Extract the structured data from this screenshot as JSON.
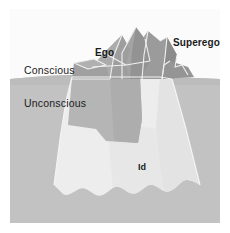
{
  "diagram": {
    "labels": {
      "conscious": "Conscious",
      "unconscious": "Unconscious",
      "ego": "Ego",
      "superego": "Superego",
      "id": "Id"
    },
    "colors": {
      "page_background": "#ffffff",
      "sky": "#fbfbfb",
      "water": "#c2c2c2",
      "water_shadow": "#b9b9b9",
      "ice_above_water": "#9b9b9b",
      "ice_above_water_light": "#b4b4b4",
      "ice_above_water_dark": "#8a8a8a",
      "ice_below_water": "#ededed",
      "ice_below_water_shade": "#e2e2e2",
      "ego_block": "#b5b5b5",
      "outline": "#f2f2f2",
      "text": "#1b1b1b"
    },
    "regions": [
      {
        "name": "conscious",
        "position": "above-waterline",
        "label": "Conscious"
      },
      {
        "name": "unconscious",
        "position": "below-waterline",
        "label": "Unconscious"
      },
      {
        "name": "ego",
        "position": "peak-left",
        "label": "Ego"
      },
      {
        "name": "superego",
        "position": "peak-right",
        "label": "Superego"
      },
      {
        "name": "id",
        "position": "submerged-mass",
        "label": "Id"
      }
    ]
  }
}
